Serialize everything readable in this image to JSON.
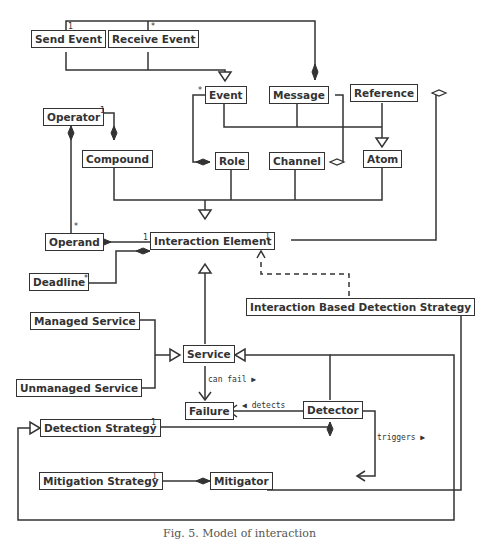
{
  "classes": {
    "send_event": "Send Event",
    "receive_event": "Receive Event",
    "event": "Event",
    "message": "Message",
    "reference": "Reference",
    "operator": "Operator",
    "compound": "Compound",
    "role": "Role",
    "channel": "Channel",
    "atom": "Atom",
    "operand": "Operand",
    "interaction_element": "Interaction Element",
    "deadline": "Deadline",
    "interaction_based_detection_strategy": "Interaction Based Detection Strategy",
    "managed_service": "Managed Service",
    "service": "Service",
    "unmanaged_service": "Unmanaged Service",
    "failure": "Failure",
    "detector": "Detector",
    "detection_strategy": "Detection Strategy",
    "mitigation_strategy": "Mitigation Strategy",
    "mitigator": "Mitigator"
  },
  "associations": {
    "can_fail": "can fail ▶",
    "detects": "◀ detects",
    "triggers": "triggers ▶"
  },
  "multiplicities": {
    "send_event": "1",
    "receive_event": "*",
    "event_role": "*",
    "operator_compound": "1",
    "operator_operand": "*",
    "operand_ie": "1",
    "ie_reference": "1",
    "deadline": "*",
    "detection_strategy": "1",
    "mitigation_strategy": "1"
  },
  "caption": "Fig. 5. Model of interaction"
}
